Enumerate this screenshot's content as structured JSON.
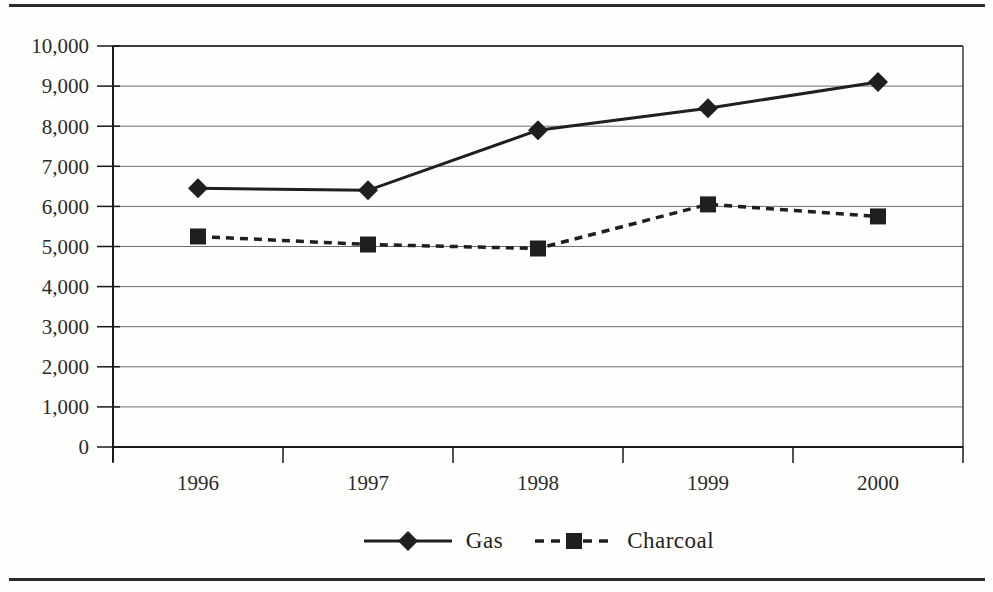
{
  "page": {
    "background": "#fefefd",
    "rule_color": "#2b2b2b"
  },
  "chart_data": {
    "type": "line",
    "title": "",
    "xlabel": "",
    "ylabel": "",
    "categories": [
      "1996",
      "1997",
      "1998",
      "1999",
      "2000"
    ],
    "series": [
      {
        "name": "Gas",
        "values": [
          6450,
          6400,
          7900,
          8450,
          9100
        ],
        "marker": "diamond",
        "line_style": "solid"
      },
      {
        "name": "Charcoal",
        "values": [
          5250,
          5050,
          4950,
          6050,
          5750
        ],
        "marker": "square",
        "line_style": "dashed"
      }
    ],
    "ylim": [
      0,
      10000
    ],
    "ytick_step": 1000,
    "ytick_labels": [
      "0",
      "1,000",
      "2,000",
      "3,000",
      "4,000",
      "5,000",
      "6,000",
      "7,000",
      "8,000",
      "9,000",
      "10,000"
    ],
    "grid": true,
    "legend_position": "bottom-center",
    "colors": {
      "series": "#1f1f1f",
      "grid": "#6e6e6e",
      "axis": "#1a1a1a",
      "border": "#3c3c3c",
      "text": "#2a2a2a"
    }
  }
}
